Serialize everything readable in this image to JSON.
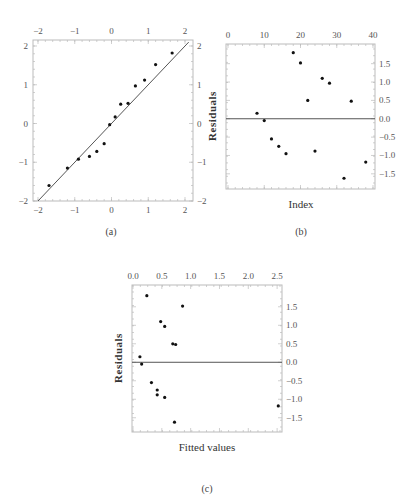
{
  "chart_data": [
    {
      "id": "a",
      "type": "scatter",
      "caption": "(a)",
      "title": "",
      "xlabel": "",
      "ylabel": "",
      "xlim": [
        -2,
        2
      ],
      "ylim": [
        -2,
        2
      ],
      "xticks": [
        -2,
        -1,
        0,
        1,
        2
      ],
      "yticks": [
        -2,
        -1,
        0,
        1,
        2
      ],
      "xtick_labels": [
        "−2",
        "−1",
        "0",
        "1",
        "2"
      ],
      "ytick_labels": [
        "−2",
        "−1",
        "0",
        "1",
        "2"
      ],
      "reference_line": {
        "kind": "diagonal",
        "from": [
          -2,
          -2
        ],
        "to": [
          2.1,
          2.1
        ]
      },
      "grid": false,
      "x": [
        -1.7,
        -1.2,
        -0.9,
        -0.6,
        -0.4,
        -0.2,
        -0.05,
        0.1,
        0.25,
        0.45,
        0.65,
        0.9,
        1.2,
        1.65
      ],
      "y": [
        -1.6,
        -1.15,
        -0.92,
        -0.85,
        -0.72,
        -0.52,
        -0.03,
        0.17,
        0.5,
        0.52,
        0.97,
        1.12,
        1.52,
        1.82
      ]
    },
    {
      "id": "b",
      "type": "scatter",
      "caption": "(b)",
      "title": "",
      "xlabel": "Index",
      "ylabel": "Residuals",
      "xlim": [
        0,
        40
      ],
      "ylim": [
        -1.75,
        1.9
      ],
      "xticks": [
        0,
        10,
        20,
        30,
        40
      ],
      "yticks": [
        -1.5,
        -1.0,
        -0.5,
        0.0,
        0.5,
        1.0,
        1.5
      ],
      "xtick_labels": [
        "0",
        "10",
        "20",
        "30",
        "40"
      ],
      "ytick_labels": [
        "−1.5",
        "−1.0",
        "−0.5",
        "0.0",
        "0.5",
        "1.0",
        "1.5"
      ],
      "reference_line": {
        "kind": "horizontal",
        "y": 0
      },
      "grid": false,
      "x": [
        8,
        10,
        12,
        14,
        16,
        18,
        20,
        22,
        24,
        26,
        28,
        32,
        34,
        38
      ],
      "y": [
        0.15,
        -0.05,
        -0.55,
        -0.75,
        -0.95,
        1.8,
        1.52,
        0.5,
        -0.88,
        1.1,
        0.97,
        -1.62,
        0.48,
        -1.18
      ]
    },
    {
      "id": "c",
      "type": "scatter",
      "caption": "(c)",
      "title": "",
      "xlabel": "Fitted values",
      "ylabel": "Residuals",
      "xlim": [
        0,
        2.55
      ],
      "ylim": [
        -1.75,
        1.9
      ],
      "xticks": [
        0.0,
        0.5,
        1.0,
        1.5,
        2.0,
        2.5
      ],
      "yticks": [
        -1.5,
        -1.0,
        -0.5,
        0.0,
        0.5,
        1.0,
        1.5
      ],
      "xtick_labels": [
        "0.0",
        "0.5",
        "1.0",
        "1.5",
        "2.0",
        "2.5"
      ],
      "ytick_labels": [
        "−1.5",
        "−1.0",
        "−0.5",
        "0.0",
        "0.5",
        "1.0",
        "1.5"
      ],
      "reference_line": {
        "kind": "horizontal",
        "y": 0
      },
      "grid": false,
      "x": [
        0.12,
        0.15,
        0.24,
        0.32,
        0.42,
        0.42,
        0.48,
        0.55,
        0.55,
        0.69,
        0.72,
        0.74,
        0.86,
        2.52
      ],
      "y": [
        0.15,
        -0.05,
        1.8,
        -0.55,
        -0.75,
        -0.88,
        1.1,
        0.97,
        -0.95,
        0.5,
        -1.62,
        0.48,
        1.52,
        -1.18
      ]
    }
  ]
}
